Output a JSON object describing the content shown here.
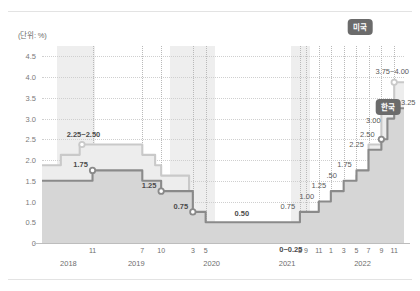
{
  "unit_label": "(단위: %)",
  "badges": [
    {
      "name": "us-badge",
      "text": "미국",
      "x": 360,
      "y": 27,
      "color": "#6b6b6b"
    },
    {
      "name": "kr-badge",
      "text": "한국",
      "x": 388,
      "y": 107,
      "color": "#6b6b6b"
    }
  ],
  "colors": {
    "us_line": "#c9c9c9",
    "us_fill": "#ededed",
    "kr_line": "#8a8a8a",
    "kr_fill": "#d6d6d6",
    "grid": "#cfcfcf",
    "axis": "#bdbdbd",
    "band": "#ebebeb",
    "text": "#5a5a5a"
  },
  "chart_data": {
    "type": "line",
    "title": "",
    "subtitle": "",
    "xlabel": "",
    "ylabel": "(단위: %)",
    "ylim": [
      0,
      4.75
    ],
    "yticks": [
      "0",
      "0.5",
      "1.0",
      "1.5",
      "2.0",
      "2.5",
      "3.0",
      "3.5",
      "4.0",
      "4.5"
    ],
    "ytick_values": [
      0,
      0.5,
      1.0,
      1.5,
      2.0,
      2.5,
      3.0,
      3.5,
      4.0,
      4.5
    ],
    "grid": "horizontal-dotted",
    "legend": "inline-badges",
    "step": "post",
    "xtick_labels": [
      "11",
      "7",
      "10",
      "3",
      "5",
      "8",
      "9",
      "11",
      "1",
      "3",
      "5",
      "7",
      "9",
      "11"
    ],
    "xtick_times": [
      2018.92,
      2019.58,
      2019.83,
      2020.25,
      2020.42,
      2021.67,
      2021.75,
      2021.92,
      2022.08,
      2022.25,
      2022.42,
      2022.58,
      2022.75,
      2022.92
    ],
    "year_labels": [
      "2018",
      "2019",
      "2020",
      "2021",
      "2022"
    ],
    "year_positions": [
      2018.6,
      2019.5,
      2020.5,
      2021.5,
      2022.5
    ],
    "xlim": [
      2018.25,
      2023.05
    ],
    "series": [
      {
        "name": "미국",
        "style": "light",
        "points": [
          {
            "t": 2018.25,
            "v": 1.875
          },
          {
            "t": 2018.5,
            "v": 2.125
          },
          {
            "t": 2018.75,
            "v": 2.375
          },
          {
            "t": 2018.92,
            "v": 2.375
          },
          {
            "t": 2019.0,
            "v": 2.375
          },
          {
            "t": 2019.58,
            "v": 2.125
          },
          {
            "t": 2019.75,
            "v": 1.875
          },
          {
            "t": 2019.83,
            "v": 1.625
          },
          {
            "t": 2020.2,
            "v": 1.125
          },
          {
            "t": 2020.25,
            "v": 0.125
          },
          {
            "t": 2022.08,
            "v": 0.375
          },
          {
            "t": 2022.25,
            "v": 0.875
          },
          {
            "t": 2022.42,
            "v": 1.625
          },
          {
            "t": 2022.58,
            "v": 2.375
          },
          {
            "t": 2022.75,
            "v": 3.125
          },
          {
            "t": 2022.92,
            "v": 3.875
          },
          {
            "t": 2023.05,
            "v": 3.875
          }
        ],
        "value_labels": [
          {
            "t": 2018.8,
            "v": 2.375,
            "text": "2.25~2.50",
            "marker": true,
            "marker_t": 2018.78,
            "bold": true
          },
          {
            "t": 2021.55,
            "v": 0.125,
            "text": "0~0.25",
            "bold": true
          },
          {
            "t": 2022.92,
            "v": 3.875,
            "text": "3.75~4.00",
            "marker": true,
            "bold": false
          }
        ]
      },
      {
        "name": "한국",
        "style": "dark",
        "points": [
          {
            "t": 2018.25,
            "v": 1.5
          },
          {
            "t": 2018.92,
            "v": 1.75
          },
          {
            "t": 2019.58,
            "v": 1.5
          },
          {
            "t": 2019.83,
            "v": 1.25
          },
          {
            "t": 2020.25,
            "v": 0.75
          },
          {
            "t": 2020.42,
            "v": 0.5
          },
          {
            "t": 2021.67,
            "v": 0.75
          },
          {
            "t": 2021.92,
            "v": 1.0
          },
          {
            "t": 2022.08,
            "v": 1.25
          },
          {
            "t": 2022.25,
            "v": 1.5
          },
          {
            "t": 2022.42,
            "v": 1.75
          },
          {
            "t": 2022.58,
            "v": 2.25
          },
          {
            "t": 2022.75,
            "v": 2.5
          },
          {
            "t": 2022.83,
            "v": 3.0
          },
          {
            "t": 2022.92,
            "v": 3.25
          },
          {
            "t": 2023.05,
            "v": 3.25
          }
        ],
        "value_labels": [
          {
            "t": 2018.92,
            "v": 1.75,
            "text": "1.75",
            "marker": true,
            "bold": true
          },
          {
            "t": 2019.83,
            "v": 1.25,
            "text": "1.25",
            "marker": true,
            "bold": true
          },
          {
            "t": 2020.25,
            "v": 0.75,
            "text": "0.75",
            "marker": true,
            "bold": true
          },
          {
            "t": 2020.9,
            "v": 0.5,
            "text": "0.50",
            "bold": true
          },
          {
            "t": 2021.67,
            "v": 0.75,
            "text": "0.75",
            "bold": false
          },
          {
            "t": 2021.92,
            "v": 1.0,
            "text": "1.00",
            "bold": false
          },
          {
            "t": 2022.08,
            "v": 1.25,
            "text": "1.25",
            "bold": false
          },
          {
            "t": 2022.25,
            "v": 1.5,
            "text": ".50",
            "bold": false
          },
          {
            "t": 2022.42,
            "v": 1.75,
            "text": "1.75",
            "bold": false
          },
          {
            "t": 2022.58,
            "v": 2.25,
            "text": "2.25",
            "bold": false
          },
          {
            "t": 2022.75,
            "v": 2.5,
            "text": "2.50",
            "marker": true,
            "bold": false
          },
          {
            "t": 2022.83,
            "v": 3.0,
            "text": "3.00",
            "bold": false
          },
          {
            "t": 2022.92,
            "v": 3.25,
            "text": "3.25",
            "marker": true,
            "bold": false
          }
        ]
      }
    ],
    "shaded_bands": [
      {
        "from": 2018.45,
        "to": 2018.95
      },
      {
        "from": 2019.95,
        "to": 2020.55
      },
      {
        "from": 2021.55,
        "to": 2021.8
      }
    ]
  }
}
